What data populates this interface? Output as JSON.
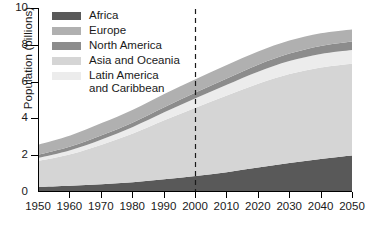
{
  "chart_data": {
    "type": "area",
    "stacked": true,
    "title": "",
    "xlabel": "",
    "ylabel": "Population (billions)",
    "xlim": [
      1950,
      2050
    ],
    "ylim": [
      0,
      10
    ],
    "xticks": [
      1950,
      1960,
      1970,
      1980,
      1990,
      2000,
      2010,
      2020,
      2030,
      2040,
      2050
    ],
    "yticks": [
      0,
      2,
      4,
      6,
      8,
      10
    ],
    "grid": false,
    "legend_position": "upper-left-inside",
    "x": [
      1950,
      1960,
      1970,
      1980,
      1990,
      2000,
      2010,
      2020,
      2030,
      2040,
      2050
    ],
    "series": [
      {
        "name": "Africa",
        "color": "#595959",
        "stack_order": 1,
        "values": [
          0.23,
          0.29,
          0.37,
          0.48,
          0.64,
          0.82,
          1.03,
          1.28,
          1.53,
          1.75,
          1.94
        ]
      },
      {
        "name": "Asia and Oceania",
        "color": "#d5d5d5",
        "stack_order": 2,
        "values": [
          1.42,
          1.72,
          2.16,
          2.66,
          3.22,
          3.73,
          4.19,
          4.58,
          4.86,
          5.0,
          5.02
        ]
      },
      {
        "name": "Latin America and Caribbean",
        "color": "#ececec",
        "stack_order": 3,
        "values": [
          0.17,
          0.22,
          0.29,
          0.36,
          0.44,
          0.52,
          0.59,
          0.66,
          0.71,
          0.74,
          0.75
        ]
      },
      {
        "name": "North America",
        "color": "#8c8c8c",
        "stack_order": 4,
        "values": [
          0.17,
          0.2,
          0.23,
          0.25,
          0.28,
          0.31,
          0.34,
          0.38,
          0.41,
          0.44,
          0.46
        ]
      },
      {
        "name": "Europe",
        "color": "#b0b0b0",
        "stack_order": 5,
        "values": [
          0.55,
          0.6,
          0.66,
          0.69,
          0.72,
          0.73,
          0.73,
          0.72,
          0.71,
          0.69,
          0.66
        ]
      }
    ],
    "totals": [
      2.54,
      3.03,
      3.71,
      4.44,
      5.3,
      6.11,
      6.88,
      7.62,
      8.22,
      8.62,
      8.83
    ],
    "annotations": [
      {
        "type": "vertical-dashed-line",
        "x": 2000,
        "label": "",
        "color": "#1a1a1a",
        "note": "divides historical estimates from projections"
      }
    ]
  },
  "axes": {
    "y_title": "Population (billions)",
    "y_tick_labels": [
      "0",
      "2",
      "4",
      "6",
      "8",
      "10"
    ],
    "x_tick_labels": [
      "1950",
      "1960",
      "1970",
      "1980",
      "1990",
      "2000",
      "2010",
      "2020",
      "2030",
      "2040",
      "2050"
    ]
  },
  "legend": {
    "items": [
      {
        "label": "Africa",
        "color": "#595959"
      },
      {
        "label": "Europe",
        "color": "#b0b0b0"
      },
      {
        "label": "North America",
        "color": "#8c8c8c"
      },
      {
        "label": "Asia and Oceania",
        "color": "#d5d5d5"
      },
      {
        "label": "Latin America\n    and Caribbean",
        "color": "#ececec"
      }
    ]
  }
}
